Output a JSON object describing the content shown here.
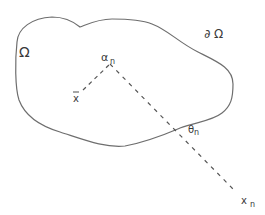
{
  "figure": {
    "region_label": "Ω",
    "boundary_label": "∂ Ω",
    "vertex_label": {
      "main": "α",
      "sub": "n"
    },
    "point_label": "x",
    "angle_label": {
      "main": "θ",
      "sub": "n"
    },
    "far_point_label": {
      "main": "x",
      "sub": "n"
    },
    "colors": {
      "stroke": "#6e6e6e",
      "dash": "#555555",
      "text": "#3a3a3a",
      "background": "#ffffff"
    }
  }
}
